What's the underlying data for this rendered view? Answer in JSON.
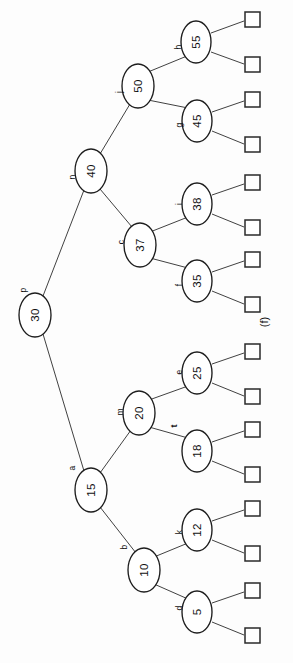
{
  "figure": {
    "caption": "(f)",
    "orientation_note": "rotated-90-ccw",
    "colors": {
      "background": "#fdfdfd",
      "stroke": "#1d1d1d",
      "edge": "#2b2b2b",
      "node_fill": "#ffffff",
      "text": "#111111"
    }
  },
  "chart_data": {
    "type": "diagram",
    "subtype": "binary-search-tree",
    "title": "(f)",
    "node_count": 15,
    "null_leaf_count": 16,
    "depth": 4,
    "nodes": [
      {
        "id": "n30",
        "value": "30",
        "tag": "p",
        "tag_bold": false,
        "depth": 0,
        "cx": 35,
        "cy": 315,
        "rx": 16,
        "ry": 22,
        "tag_x": 23,
        "tag_y": 290
      },
      {
        "id": "n40",
        "value": "40",
        "tag": "n",
        "tag_bold": false,
        "depth": 1,
        "cx": 91,
        "cy": 171,
        "rx": 16,
        "ry": 22,
        "tag_x": 72,
        "tag_y": 177
      },
      {
        "id": "n15",
        "value": "15",
        "tag": "a",
        "tag_bold": false,
        "depth": 1,
        "cx": 91,
        "cy": 490,
        "rx": 16,
        "ry": 22,
        "tag_x": 72,
        "tag_y": 468
      },
      {
        "id": "n50",
        "value": "50",
        "tag": "j",
        "tag_bold": false,
        "depth": 2,
        "cx": 138,
        "cy": 86,
        "rx": 16,
        "ry": 22,
        "tag_x": 119,
        "tag_y": 92
      },
      {
        "id": "n37",
        "value": "37",
        "tag": "c",
        "tag_bold": false,
        "depth": 2,
        "cx": 140,
        "cy": 245,
        "rx": 16,
        "ry": 22,
        "tag_x": 121,
        "tag_y": 242
      },
      {
        "id": "n20",
        "value": "20",
        "tag": "m",
        "tag_bold": false,
        "depth": 2,
        "cx": 139,
        "cy": 413,
        "rx": 16,
        "ry": 22,
        "tag_x": 120,
        "tag_y": 412
      },
      {
        "id": "n10",
        "value": "10",
        "tag": "b",
        "tag_bold": false,
        "depth": 2,
        "cx": 144,
        "cy": 570,
        "rx": 16,
        "ry": 22,
        "tag_x": 124,
        "tag_y": 547
      },
      {
        "id": "n55",
        "value": "55",
        "tag": "h",
        "tag_bold": false,
        "depth": 3,
        "cx": 196,
        "cy": 42,
        "rx": 15,
        "ry": 21,
        "tag_x": 178,
        "tag_y": 47
      },
      {
        "id": "n45",
        "value": "45",
        "tag": "g",
        "tag_bold": false,
        "depth": 3,
        "cx": 197,
        "cy": 121,
        "rx": 15,
        "ry": 21,
        "tag_x": 179,
        "tag_y": 125
      },
      {
        "id": "n38",
        "value": "38",
        "tag": "i",
        "tag_bold": false,
        "depth": 3,
        "cx": 197,
        "cy": 204,
        "rx": 15,
        "ry": 21,
        "tag_x": 179,
        "tag_y": 204
      },
      {
        "id": "n35",
        "value": "35",
        "tag": "f",
        "tag_bold": false,
        "depth": 3,
        "cx": 197,
        "cy": 281,
        "rx": 15,
        "ry": 21,
        "tag_x": 179,
        "tag_y": 285
      },
      {
        "id": "n25",
        "value": "25",
        "tag": "e",
        "tag_bold": false,
        "depth": 3,
        "cx": 197,
        "cy": 373,
        "rx": 15,
        "ry": 21,
        "tag_x": 179,
        "tag_y": 372
      },
      {
        "id": "n18",
        "value": "18",
        "tag": "t",
        "tag_bold": true,
        "depth": 3,
        "cx": 197,
        "cy": 451,
        "rx": 15,
        "ry": 21,
        "tag_x": 174,
        "tag_y": 426
      },
      {
        "id": "n12",
        "value": "12",
        "tag": "k",
        "tag_bold": false,
        "depth": 3,
        "cx": 197,
        "cy": 530,
        "rx": 15,
        "ry": 21,
        "tag_x": 179,
        "tag_y": 532
      },
      {
        "id": "n5",
        "value": "5",
        "tag": "d",
        "tag_bold": false,
        "depth": 3,
        "cx": 197,
        "cy": 612,
        "rx": 15,
        "ry": 21,
        "tag_x": 179,
        "tag_y": 608
      }
    ],
    "edges": [
      {
        "from": "n30",
        "to": "n40",
        "x1": 43,
        "y1": 296,
        "x2": 84,
        "y2": 190
      },
      {
        "from": "n30",
        "to": "n15",
        "x1": 43,
        "y1": 334,
        "x2": 84,
        "y2": 471
      },
      {
        "from": "n40",
        "to": "n50",
        "x1": 100,
        "y1": 154,
        "x2": 130,
        "y2": 104
      },
      {
        "from": "n40",
        "to": "n37",
        "x1": 100,
        "y1": 189,
        "x2": 132,
        "y2": 227
      },
      {
        "from": "n15",
        "to": "n20",
        "x1": 100,
        "y1": 473,
        "x2": 131,
        "y2": 430
      },
      {
        "from": "n15",
        "to": "n10",
        "x1": 100,
        "y1": 507,
        "x2": 136,
        "y2": 553
      },
      {
        "from": "n50",
        "to": "n55",
        "x1": 148,
        "y1": 72,
        "x2": 187,
        "y2": 56
      },
      {
        "from": "n50",
        "to": "n45",
        "x1": 148,
        "y1": 100,
        "x2": 188,
        "y2": 108
      },
      {
        "from": "n37",
        "to": "n38",
        "x1": 150,
        "y1": 232,
        "x2": 188,
        "y2": 217
      },
      {
        "from": "n37",
        "to": "n35",
        "x1": 150,
        "y1": 258,
        "x2": 188,
        "y2": 268
      },
      {
        "from": "n20",
        "to": "n25",
        "x1": 149,
        "y1": 400,
        "x2": 188,
        "y2": 386
      },
      {
        "from": "n20",
        "to": "n18",
        "x1": 149,
        "y1": 427,
        "x2": 188,
        "y2": 438
      },
      {
        "from": "n10",
        "to": "n12",
        "x1": 154,
        "y1": 557,
        "x2": 188,
        "y2": 543
      },
      {
        "from": "n10",
        "to": "n5",
        "x1": 154,
        "y1": 584,
        "x2": 188,
        "y2": 599
      }
    ],
    "null_leaves": [
      {
        "id": "sq1",
        "parent": "n55",
        "x": 245,
        "y": 12,
        "w": 15,
        "h": 15,
        "lx1": 211,
        "ly1": 33,
        "lx2": 244,
        "ly2": 21
      },
      {
        "id": "sq2",
        "parent": "n55",
        "x": 245,
        "y": 57,
        "w": 15,
        "h": 15,
        "lx1": 211,
        "ly1": 52,
        "lx2": 244,
        "ly2": 64
      },
      {
        "id": "sq3",
        "parent": "n45",
        "x": 245,
        "y": 92,
        "w": 15,
        "h": 15,
        "lx1": 212,
        "ly1": 112,
        "lx2": 244,
        "ly2": 101
      },
      {
        "id": "sq4",
        "parent": "n45",
        "x": 245,
        "y": 137,
        "w": 15,
        "h": 15,
        "lx1": 212,
        "ly1": 131,
        "lx2": 244,
        "ly2": 144
      },
      {
        "id": "sq5",
        "parent": "n38",
        "x": 245,
        "y": 175,
        "w": 15,
        "h": 15,
        "lx1": 212,
        "ly1": 195,
        "lx2": 244,
        "ly2": 184
      },
      {
        "id": "sq6",
        "parent": "n38",
        "x": 245,
        "y": 220,
        "w": 15,
        "h": 15,
        "lx1": 212,
        "ly1": 214,
        "lx2": 244,
        "ly2": 227
      },
      {
        "id": "sq7",
        "parent": "n35",
        "x": 245,
        "y": 252,
        "w": 15,
        "h": 15,
        "lx1": 212,
        "ly1": 272,
        "lx2": 244,
        "ly2": 261
      },
      {
        "id": "sq8",
        "parent": "n35",
        "x": 245,
        "y": 297,
        "w": 15,
        "h": 15,
        "lx1": 212,
        "ly1": 291,
        "lx2": 244,
        "ly2": 304
      },
      {
        "id": "sq9",
        "parent": "n25",
        "x": 245,
        "y": 344,
        "w": 15,
        "h": 15,
        "lx1": 212,
        "ly1": 364,
        "lx2": 244,
        "ly2": 353
      },
      {
        "id": "sq10",
        "parent": "n25",
        "x": 245,
        "y": 389,
        "w": 15,
        "h": 15,
        "lx1": 212,
        "ly1": 383,
        "lx2": 244,
        "ly2": 396
      },
      {
        "id": "sq11",
        "parent": "n18",
        "x": 245,
        "y": 422,
        "w": 15,
        "h": 15,
        "lx1": 212,
        "ly1": 442,
        "lx2": 244,
        "ly2": 431
      },
      {
        "id": "sq12",
        "parent": "n18",
        "x": 245,
        "y": 467,
        "w": 15,
        "h": 15,
        "lx1": 212,
        "ly1": 461,
        "lx2": 244,
        "ly2": 474
      },
      {
        "id": "sq13",
        "parent": "n12",
        "x": 245,
        "y": 501,
        "w": 15,
        "h": 15,
        "lx1": 212,
        "ly1": 521,
        "lx2": 244,
        "ly2": 510
      },
      {
        "id": "sq14",
        "parent": "n12",
        "x": 245,
        "y": 546,
        "w": 15,
        "h": 15,
        "lx1": 212,
        "ly1": 540,
        "lx2": 244,
        "ly2": 553
      },
      {
        "id": "sq15",
        "parent": "n5",
        "x": 245,
        "y": 583,
        "w": 15,
        "h": 15,
        "lx1": 212,
        "ly1": 603,
        "lx2": 244,
        "ly2": 592
      },
      {
        "id": "sq16",
        "parent": "n5",
        "x": 245,
        "y": 628,
        "w": 15,
        "h": 15,
        "lx1": 212,
        "ly1": 622,
        "lx2": 244,
        "ly2": 635
      }
    ],
    "caption": {
      "text": "(f)",
      "x": 264,
      "y": 322
    }
  }
}
